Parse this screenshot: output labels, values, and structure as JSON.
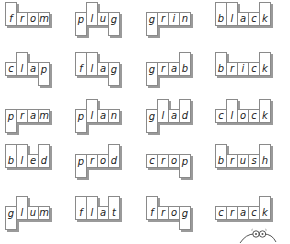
{
  "worksheet": {
    "rows": [
      [
        {
          "word": "from",
          "shape": [
            "a",
            "x",
            "x",
            "x"
          ]
        },
        {
          "word": "plug",
          "shape": [
            "d",
            "a",
            "x",
            "d"
          ]
        },
        {
          "word": "grin",
          "shape": [
            "d",
            "x",
            "x",
            "x"
          ]
        },
        {
          "word": "black",
          "shape": [
            "a",
            "a",
            "x",
            "x",
            "a"
          ]
        }
      ],
      [
        {
          "word": "clap",
          "shape": [
            "x",
            "a",
            "x",
            "d"
          ]
        },
        {
          "word": "flag",
          "shape": [
            "a",
            "a",
            "x",
            "d"
          ]
        },
        {
          "word": "grab",
          "shape": [
            "d",
            "x",
            "x",
            "a"
          ]
        },
        {
          "word": "brick",
          "shape": [
            "a",
            "x",
            "x",
            "x",
            "a"
          ]
        }
      ],
      [
        {
          "word": "pram",
          "shape": [
            "d",
            "x",
            "x",
            "x"
          ]
        },
        {
          "word": "plan",
          "shape": [
            "d",
            "a",
            "x",
            "x"
          ]
        },
        {
          "word": "glad",
          "shape": [
            "d",
            "a",
            "x",
            "a"
          ]
        },
        {
          "word": "clock",
          "shape": [
            "x",
            "a",
            "x",
            "x",
            "a"
          ]
        }
      ],
      [
        {
          "word": "bled",
          "shape": [
            "a",
            "a",
            "x",
            "a"
          ]
        },
        {
          "word": "prod",
          "shape": [
            "d",
            "x",
            "x",
            "a"
          ]
        },
        {
          "word": "crop",
          "shape": [
            "x",
            "x",
            "x",
            "d"
          ]
        },
        {
          "word": "brush",
          "shape": [
            "a",
            "x",
            "x",
            "x",
            "a"
          ]
        }
      ],
      [
        {
          "word": "glum",
          "shape": [
            "d",
            "a",
            "x",
            "x"
          ]
        },
        {
          "word": "flat",
          "shape": [
            "a",
            "a",
            "x",
            "a"
          ]
        },
        {
          "word": "frog",
          "shape": [
            "a",
            "x",
            "x",
            "d"
          ]
        },
        {
          "word": "crack",
          "shape": [
            "x",
            "x",
            "x",
            "x",
            "a"
          ]
        }
      ]
    ],
    "decoration": "caterpillar-character"
  }
}
